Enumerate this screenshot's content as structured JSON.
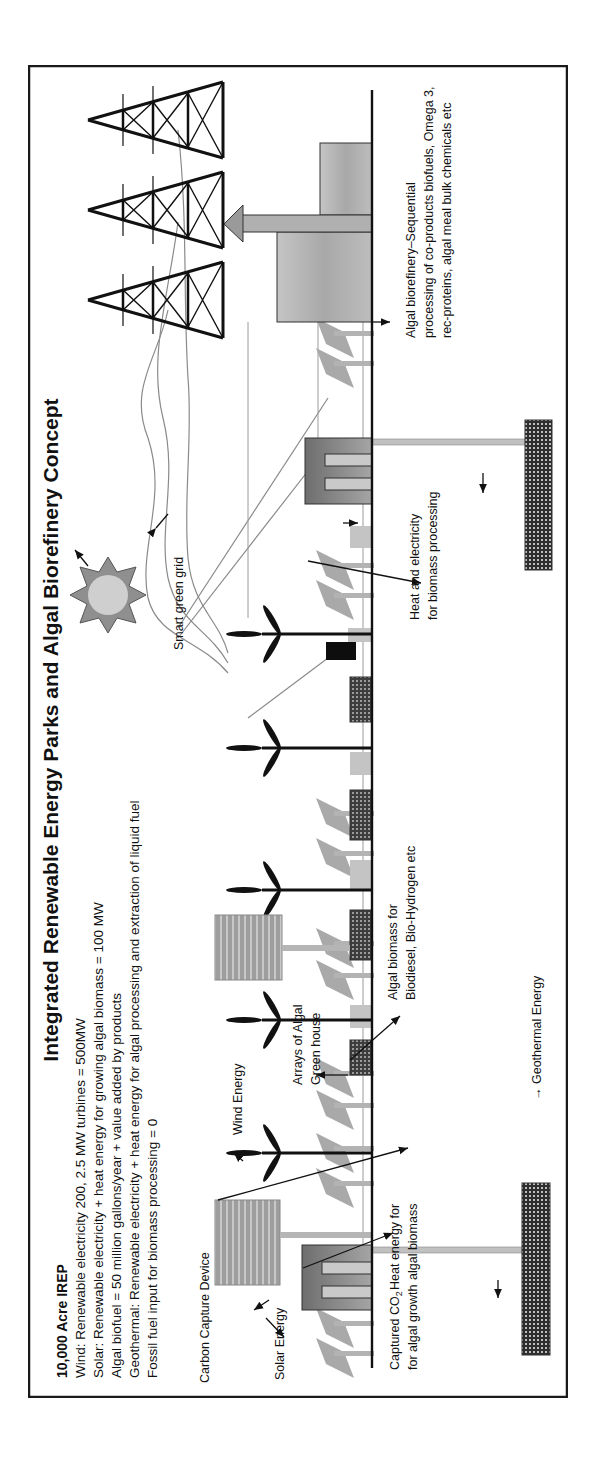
{
  "figure": {
    "title": "Integrated Renewable Energy Parks and Algal Biorefinery Concept",
    "orientation": "rotated 90° counter-clockwise",
    "info_block": {
      "heading": "10,000 Acre IREP",
      "lines": [
        "Wind: Renewable electricity 200, 2.5 MW turbines = 500MW",
        "Solar: Renewable electricity + heat energy for growing algal biomass = 100 MW",
        "Algal biofuel = 50 million gallons/year + value added by products",
        "Geothermal: Renewable electricity + heat energy for algal processing and extraction of liquid fuel",
        "Fossil fuel input for biomass processing = 0"
      ]
    },
    "labels": {
      "carbon_capture": "Carbon Capture Device",
      "solar_energy": "Solar Energy",
      "captured_co2_line1": "Captured CO",
      "captured_co2_sub": "2",
      "captured_co2_line2": "for algal growth",
      "heat_energy_line1": "Heat energy for",
      "heat_energy_line2": "algal biomass",
      "wind_energy": "Wind Energy",
      "arrays_line1": "Arrays of Algal",
      "arrays_line2": "Green house",
      "algal_biomass_line1": "Algal biomass for",
      "algal_biomass_line2": "Biodiesel, Bio-Hydrogen etc",
      "geothermal_energy": "→ Geothermal Energy",
      "heat_electricity_line1": "Heat and electricity",
      "heat_electricity_line2": "for biomass processing",
      "smart_grid": "Smart green grid",
      "biorefinery_line1": "Algal biorefinery–Sequential",
      "biorefinery_line2": "processing of co-products biofuels, Omega 3,",
      "biorefinery_line3": "rec-proteins, algal meal bulk chemicals etc"
    },
    "colors": {
      "border": "#1a1a1a",
      "panel_gray": "#a9a9a9",
      "plant_gray": "#7d7d7d",
      "building_gray": "#b8b8b8",
      "greenhouse_dark": "#4a4a4a",
      "light_gray": "#c4c4c4",
      "sun_outer": "#8f8f8f",
      "sun_inner": "#cfcfcf"
    },
    "components": {
      "wind_turbines": 5,
      "power_towers": 3,
      "greenhouses": 4,
      "carbon_capture_devices": 2,
      "power_plants": 2,
      "geothermal_wells": 2,
      "biorefinery_buildings": 2
    }
  }
}
